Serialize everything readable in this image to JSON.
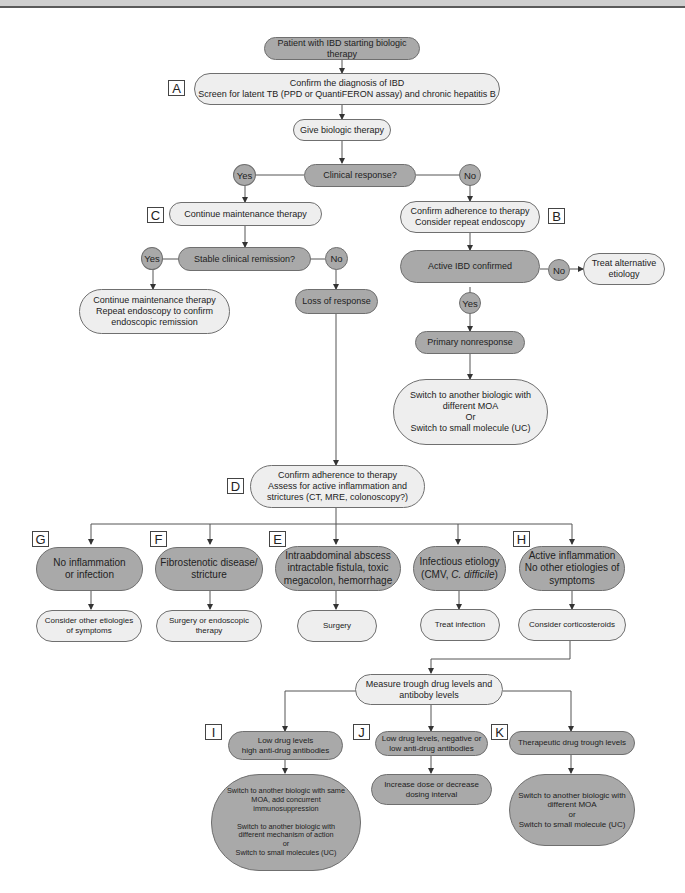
{
  "figure": {
    "colors": {
      "decision_fill": "#a9a9a9",
      "action_fill": "#eeeeee",
      "border": "#6f6f6f",
      "line": "#555555"
    },
    "tags": {
      "A": "A",
      "B": "B",
      "C": "C",
      "D": "D",
      "E": "E",
      "F": "F",
      "G": "G",
      "H": "H",
      "I": "I",
      "J": "J",
      "K": "K"
    },
    "nodes": {
      "start": "Patient with IBD starting biologic therapy",
      "confirm_diagnosis": "Confirm the diagnosis of IBD\nScreen for latent TB (PPD or QuantiFERON assay) and chronic hepatitis B",
      "give_biologic": "Give biologic therapy",
      "clinical_response": "Clinical response?",
      "continue_maintenance": "Continue maintenance therapy",
      "stable_remission": "Stable clinical remission?",
      "continue_repeat_endoscopy": "Continue maintenance therapy\nRepeat endoscopy to confirm\nendoscopic remission",
      "loss_of_response": "Loss of response",
      "confirm_adherence_b": "Confirm adherence to therapy\nConsider repeat endoscopy",
      "active_ibd_confirmed": "Active IBD confirmed",
      "treat_alternative": "Treat alternative\netiology",
      "primary_nonresponse": "Primary nonresponse",
      "switch_primary": "Switch to another biologic with\ndifferent MOA\nOr\nSwitch to small molecule (UC)",
      "confirm_adherence_d": "Confirm adherence to therapy\nAssess for active inflammation and\nstrictures (CT, MRE, colonoscopy?)",
      "no_inflammation": "No inflammation\nor infection",
      "fibrostenotic": "Fibrostenotic disease/\nstricture",
      "intraabdominal": "Intraabdominal abscess\nintractable fistula, toxic\nmegacolon, hemorrhage",
      "infectious_line1": "Infectious etiology",
      "infectious_line2_pre": "(CMV, ",
      "infectious_line2_italic": "C. difficile",
      "infectious_line2_post": ")",
      "active_inflammation": "Active inflammation\nNo other etiologies of\nsymptoms",
      "consider_other": "Consider other etiologies\nof symptoms",
      "surgery_endoscopic": "Surgery or endoscopic\ntherapy",
      "surgery": "Surgery",
      "treat_infection": "Treat infection",
      "consider_corticosteroids": "Consider corticosteroids",
      "measure_trough": "Measure trough drug levels and\nantiboby levels",
      "low_high_ab": "Low drug levels\nhigh anti-drug antibodies",
      "low_neg_ab": "Low drug levels, negative or\nlow anti-drug antibodies",
      "therapeutic_trough": "Therapeutic drug trough levels",
      "switch_same_moa": "Switch to another biologic with same\nMOA, add concurrent\nimmunosuppression\n\nSwitch to another biologic with\ndifferent mechanism of action\nor\nSwitch to small molecules (UC)",
      "increase_dose": "Increase dose or decrease\ndosing interval",
      "switch_k": "Switch to another biologic with\ndifferent MOA\nor\nSwitch to small molecule (UC)"
    },
    "branches": {
      "yes": "Yes",
      "no": "No"
    }
  }
}
